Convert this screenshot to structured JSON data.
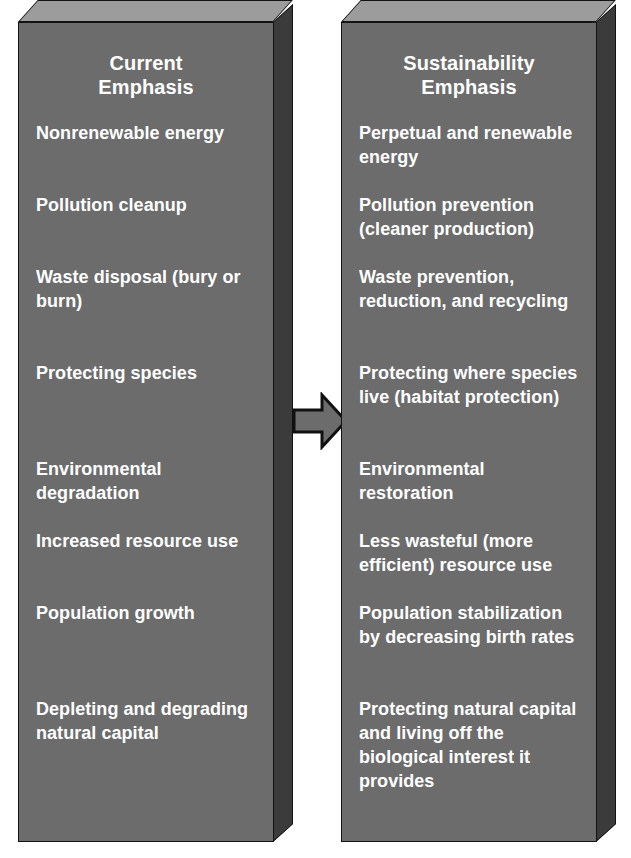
{
  "figure": {
    "type": "two-column-comparison-diagram",
    "arrow_icon": "right-arrow-icon",
    "colors": {
      "panel_front": "#6c6c6c",
      "panel_top": "#9c9c9c",
      "panel_side": "#3b3b3b",
      "outline": "#131313",
      "text": "#ffffff",
      "arrow_fill": "#6c6c6c",
      "background": "#ffffff"
    }
  },
  "left_panel": {
    "title": "Current\nEmphasis",
    "title_line1": "Current",
    "title_line2": "Emphasis",
    "items": [
      "Nonrenewable energy",
      "Pollution cleanup",
      "Waste disposal (bury or burn)",
      "Protecting species",
      "Environmental degradation",
      "Increased resource use",
      "Population growth",
      "Depleting and degrading natural capital"
    ]
  },
  "right_panel": {
    "title": "Sustainability\nEmphasis",
    "title_line1": "Sustainability",
    "title_line2": "Emphasis",
    "items": [
      "Perpetual and renewable energy",
      "Pollution prevention (cleaner production)",
      "Waste prevention, reduction, and recycling",
      "Protecting where species live (habitat protection)",
      "Environmental restoration",
      "Less wasteful (more efficient) resource use",
      "Population stabilization by decreasing birth rates",
      "Protecting natural capital and living off the biological interest it provides"
    ]
  },
  "row_heights": [
    72,
    72,
    96,
    96,
    72,
    72,
    96,
    120
  ]
}
